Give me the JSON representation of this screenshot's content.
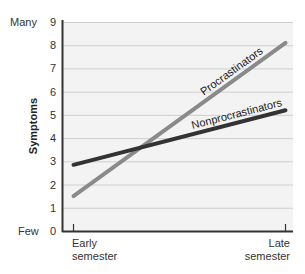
{
  "chart_data": {
    "type": "line",
    "title": "",
    "xlabel": "",
    "ylabel": "Symptoms",
    "categories": [
      "Early semester",
      "Late semester"
    ],
    "x_tick_labels": [
      [
        "Early",
        "semester"
      ],
      [
        "Late",
        "semester"
      ]
    ],
    "ylim": [
      0,
      9
    ],
    "y_ticks": [
      0,
      1,
      2,
      3,
      4,
      5,
      6,
      7,
      8,
      9
    ],
    "y_end_labels": {
      "top": "Many",
      "bottom": "Few"
    },
    "grid": true,
    "legend": "inline labels on lines",
    "series": [
      {
        "name": "Procrastinators",
        "values": [
          1.5,
          8.1
        ],
        "color": "#8a8a8a"
      },
      {
        "name": "Nonprocrastinators",
        "values": [
          2.85,
          5.2
        ],
        "color": "#333333"
      }
    ]
  },
  "colors": {
    "plot_bg": "#f3f3f3",
    "grid": "#cfcfcf",
    "axis": "#333333"
  }
}
